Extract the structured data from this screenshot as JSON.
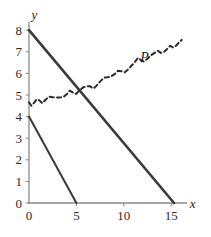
{
  "chart_data": {
    "type": "line",
    "title": "",
    "xlabel": "x",
    "ylabel": "y",
    "xlim": [
      0,
      16.6
    ],
    "ylim": [
      0,
      8.35
    ],
    "grid": false,
    "legend": "none",
    "xticks": [
      0,
      5,
      10,
      15
    ],
    "xtick_labels": [
      "0",
      "5",
      "10",
      "15"
    ],
    "yticks": [
      0,
      1,
      2,
      3,
      4,
      5,
      6,
      7,
      8
    ],
    "ytick_labels": [
      "0",
      "1",
      "2",
      "3",
      "4",
      "5",
      "6",
      "7",
      "8"
    ],
    "axis_color": "#8a8a8a",
    "series": [
      {
        "name": "budget-line-long",
        "style": "solid",
        "color": "#3a3a3a",
        "width": 2.6,
        "points": [
          [
            0,
            8
          ],
          [
            15.3,
            0
          ]
        ]
      },
      {
        "name": "budget-line-short",
        "style": "solid",
        "color": "#3a3a3a",
        "width": 2.0,
        "points": [
          [
            0,
            4
          ],
          [
            5,
            0
          ]
        ]
      },
      {
        "name": "P",
        "label": "P",
        "style": "dashed",
        "color": "#2b2b2b",
        "width": 2.0,
        "label_position": [
          12.2,
          6.55
        ],
        "points": [
          [
            0.0,
            4.66
          ],
          [
            0.25,
            4.5
          ],
          [
            0.5,
            4.62
          ],
          [
            0.8,
            4.8
          ],
          [
            1.1,
            4.75
          ],
          [
            1.4,
            4.62
          ],
          [
            1.75,
            4.78
          ],
          [
            2.1,
            4.92
          ],
          [
            2.45,
            4.9
          ],
          [
            2.8,
            4.88
          ],
          [
            3.2,
            4.88
          ],
          [
            3.6,
            4.9
          ],
          [
            3.95,
            5.02
          ],
          [
            4.3,
            5.2
          ],
          [
            4.6,
            5.12
          ],
          [
            4.95,
            5.05
          ],
          [
            5.3,
            5.2
          ],
          [
            5.7,
            5.35
          ],
          [
            6.05,
            5.4
          ],
          [
            6.45,
            5.4
          ],
          [
            6.8,
            5.3
          ],
          [
            7.1,
            5.42
          ],
          [
            7.5,
            5.62
          ],
          [
            7.9,
            5.8
          ],
          [
            8.25,
            5.82
          ],
          [
            8.6,
            5.85
          ],
          [
            9.0,
            5.95
          ],
          [
            9.4,
            6.12
          ],
          [
            9.75,
            6.1
          ],
          [
            10.1,
            6.05
          ],
          [
            10.5,
            6.2
          ],
          [
            10.9,
            6.4
          ],
          [
            11.2,
            6.55
          ],
          [
            11.5,
            6.72
          ],
          [
            11.8,
            6.62
          ],
          [
            12.1,
            6.55
          ],
          [
            12.5,
            6.68
          ],
          [
            12.9,
            6.85
          ],
          [
            13.25,
            6.95
          ],
          [
            13.6,
            7.05
          ],
          [
            13.9,
            6.95
          ],
          [
            14.2,
            6.98
          ],
          [
            14.55,
            7.12
          ],
          [
            14.9,
            7.28
          ],
          [
            15.2,
            7.2
          ],
          [
            15.5,
            7.28
          ],
          [
            15.8,
            7.42
          ],
          [
            16.1,
            7.55
          ]
        ]
      }
    ]
  }
}
